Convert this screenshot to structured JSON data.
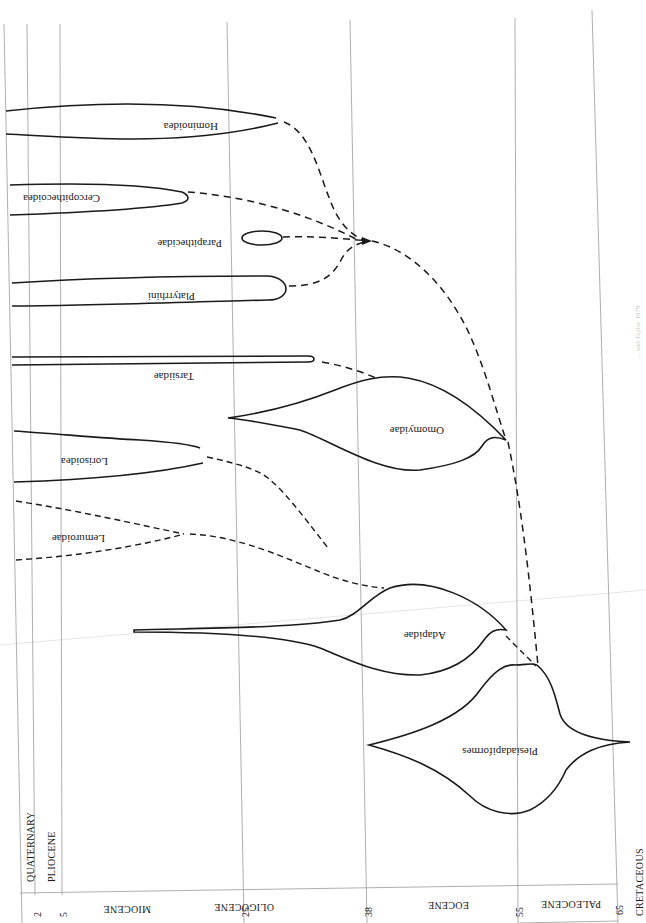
{
  "figure": {
    "orientation": "rotated-180 (upside-down page scan)",
    "time_axis": {
      "unit": "millions of years ago",
      "ticks": [
        {
          "label": "2",
          "x": 35
        },
        {
          "label": "5",
          "x": 60
        },
        {
          "label": "25",
          "x": 228
        },
        {
          "label": "38",
          "x": 352
        },
        {
          "label": "55",
          "x": 518
        },
        {
          "label": "65",
          "x": 618
        }
      ]
    },
    "epochs": [
      {
        "name": "MIOCENE",
        "x": 140
      },
      {
        "name": "OLIGOCENE",
        "x": 290
      },
      {
        "name": "EOCENE",
        "x": 435
      },
      {
        "name": "PALEOCENE",
        "x": 568
      }
    ],
    "periods": [
      {
        "name": "QUATERNARY"
      },
      {
        "name": "PLIOCENE"
      },
      {
        "name": "CRETACEOUS"
      }
    ],
    "taxa": [
      {
        "name": "Hominoidea",
        "type": "lineage"
      },
      {
        "name": "Cercopithecoidea",
        "type": "lineage"
      },
      {
        "name": "Parapithecidae",
        "type": "lineage"
      },
      {
        "name": "Platyrrhini",
        "type": "lineage"
      },
      {
        "name": "Tarsiidae",
        "type": "lineage"
      },
      {
        "name": "Omomyidae",
        "type": "lineage"
      },
      {
        "name": "Lorisoidea",
        "type": "lineage"
      },
      {
        "name": "Lemuroidae",
        "type": "lineage"
      },
      {
        "name": "Adapidae",
        "type": "lineage"
      },
      {
        "name": "Plesiadapiformes",
        "type": "lineage"
      }
    ],
    "caption_faint": "… and Taylor 1979"
  }
}
